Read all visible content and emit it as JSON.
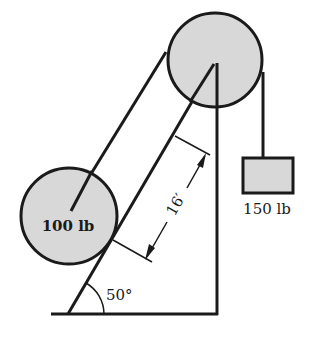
{
  "diagram": {
    "type": "statics-pulley-incline",
    "colors": {
      "ink": "#1a1a1a",
      "fill": "#d8d8d8",
      "background": "#ffffff"
    },
    "cylinder": {
      "label": "100 lb"
    },
    "hanging_block": {
      "label": "150 lb"
    },
    "incline": {
      "angle_label": "50°"
    },
    "dimension": {
      "label": "16′"
    }
  }
}
